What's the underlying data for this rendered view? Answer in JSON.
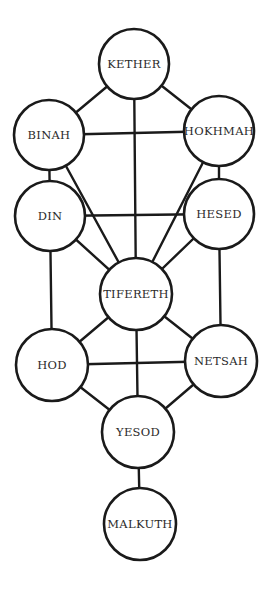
{
  "diagram": {
    "title": "",
    "colors": {
      "line": "#1a1a1a",
      "fill": "#ffffff",
      "text": "#2a2a2a"
    },
    "nodes": [
      {
        "id": "kether",
        "label": "KETHER",
        "cx": 134,
        "cy": 64,
        "r": 35
      },
      {
        "id": "binah",
        "label": "BINAH",
        "cx": 49,
        "cy": 135,
        "r": 35
      },
      {
        "id": "hokhmah",
        "label": "HOKHMAH",
        "cx": 219,
        "cy": 131,
        "r": 35
      },
      {
        "id": "din",
        "label": "DIN",
        "cx": 50,
        "cy": 216,
        "r": 35
      },
      {
        "id": "hesed",
        "label": "HESED",
        "cx": 219,
        "cy": 214,
        "r": 35
      },
      {
        "id": "tifereth",
        "label": "TIFERETH",
        "cx": 136,
        "cy": 294,
        "r": 36
      },
      {
        "id": "hod",
        "label": "HOD",
        "cx": 52,
        "cy": 365,
        "r": 36
      },
      {
        "id": "netsah",
        "label": "NETSAH",
        "cx": 221,
        "cy": 361,
        "r": 36
      },
      {
        "id": "yesod",
        "label": "YESOD",
        "cx": 138,
        "cy": 432,
        "r": 36
      },
      {
        "id": "malkuth",
        "label": "MALKUTH",
        "cx": 140,
        "cy": 524,
        "r": 36
      }
    ],
    "edges": [
      [
        "kether",
        "binah"
      ],
      [
        "kether",
        "hokhmah"
      ],
      [
        "kether",
        "tifereth"
      ],
      [
        "binah",
        "hokhmah"
      ],
      [
        "binah",
        "din"
      ],
      [
        "binah",
        "tifereth"
      ],
      [
        "hokhmah",
        "hesed"
      ],
      [
        "hokhmah",
        "tifereth"
      ],
      [
        "din",
        "hesed"
      ],
      [
        "din",
        "tifereth"
      ],
      [
        "din",
        "hod"
      ],
      [
        "hesed",
        "tifereth"
      ],
      [
        "hesed",
        "netsah"
      ],
      [
        "tifereth",
        "hod"
      ],
      [
        "tifereth",
        "netsah"
      ],
      [
        "tifereth",
        "yesod"
      ],
      [
        "hod",
        "netsah"
      ],
      [
        "hod",
        "yesod"
      ],
      [
        "netsah",
        "yesod"
      ],
      [
        "yesod",
        "malkuth"
      ]
    ]
  }
}
